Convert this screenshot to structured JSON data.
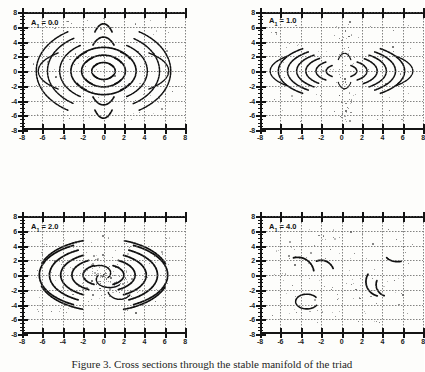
{
  "figure": {
    "caption": "Figure 3.  Cross sections through the stable manifold of the triad",
    "caption_number": "Figure 3."
  },
  "axes": {
    "x_ticks": [
      "-8",
      "-6",
      "-4",
      "-2",
      "0",
      "2",
      "4",
      "6",
      "8"
    ],
    "y_ticks": [
      "8",
      "6",
      "4",
      "2",
      "0",
      "-2",
      "-4",
      "-6",
      "-8"
    ],
    "xlim": [
      -8,
      8
    ],
    "ylim": [
      -8,
      8
    ],
    "grid": "dotted"
  },
  "panels": [
    {
      "id": "panel-a1-0",
      "label_var": "A",
      "label_sub": "1",
      "label_eq": " = 0.0",
      "value": 0.0,
      "position": "top-left"
    },
    {
      "id": "panel-a1-1",
      "label_var": "A",
      "label_sub": "1",
      "label_eq": " = 1.0",
      "value": 1.0,
      "position": "top-right"
    },
    {
      "id": "panel-a1-2",
      "label_var": "A",
      "label_sub": "1",
      "label_eq": " = 2.0",
      "value": 2.0,
      "position": "bottom-left"
    },
    {
      "id": "panel-a1-4",
      "label_var": "A",
      "label_sub": "1",
      "label_eq": " = 4.0",
      "value": 4.0,
      "position": "bottom-right"
    }
  ],
  "chart_data": {
    "type": "scatter",
    "title": "Cross sections through the stable manifold of the triad",
    "xlabel": "",
    "ylabel": "",
    "xlim": [
      -8,
      8
    ],
    "ylim": [
      -8,
      8
    ],
    "grid": true,
    "legend": "none",
    "subplots": [
      {
        "name": "A1 = 0.0",
        "parameter": "A1",
        "parameter_value": 0.0,
        "description": "Four-lobed flower of broken concentric arcs centered on origin; arcs open toward the four axis directions, nested rings at radii ~1, 2, 3, 4, 5, 6 with additional vertical lobes reaching y = +/-7.",
        "arc_rings": [
          1.2,
          2.2,
          3.2,
          4.3,
          5.4,
          6.5
        ],
        "lobes": [
          "left",
          "right",
          "up",
          "down"
        ],
        "density": "high"
      },
      {
        "name": "A1 = 1.0",
        "parameter": "A1",
        "parameter_value": 1.0,
        "description": "Arcs survive only in the left and right lobes between y = -3 and y = 3; vertical lobes dissolved into scattered speckle along the x = 0 axis.",
        "arc_rings": [
          1.5,
          2.6,
          3.6,
          4.6
        ],
        "lobes": [
          "left",
          "right"
        ],
        "density": "medium"
      },
      {
        "name": "A1 = 2.0",
        "parameter": "A1",
        "parameter_value": 2.0,
        "description": "Large nested elliptical arcs spanning x = -6 to 6 and y = -5 to 5, with a speckled stochastic core near the origin.",
        "arc_rings": [
          2.0,
          3.2,
          4.4,
          5.6,
          6.6
        ],
        "lobes": [
          "left",
          "right",
          "up",
          "down"
        ],
        "density": "high"
      },
      {
        "name": "A1 = 4.0",
        "parameter": "A1",
        "parameter_value": 4.0,
        "description": "Manifold largely destroyed; only a few short arc fragments remain near (-5,1), (-3,1), (3,-2), (4,-1) and (5,4), with sparse scattered points.",
        "arc_rings": [],
        "lobes": [],
        "density": "low"
      }
    ]
  }
}
